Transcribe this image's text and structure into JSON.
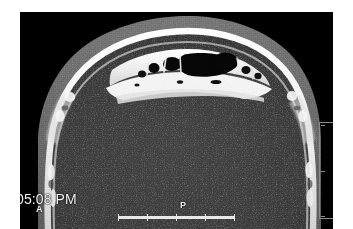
{
  "viewer": {
    "modality": "CT",
    "view": "axial",
    "region": "frontal sinuses",
    "background_color": "#ffffff",
    "image_background_color": "#000000"
  },
  "overlays": {
    "timestamp": "05:08 PM",
    "orientation_anterior": "A",
    "orientation_posterior": "P",
    "text_color": "#f2f2f2"
  },
  "scalebar": {
    "name": "horizontal-scale-bar",
    "tick_positions_pct": [
      0,
      25,
      50,
      75,
      100
    ],
    "color": "#e8e8e8"
  },
  "vertical_scale": {
    "name": "vertical-scale-bar",
    "tick_positions_pct": [
      2,
      50,
      98
    ],
    "color": "#8d8d8d"
  },
  "anatomy": {
    "scalp_color": "#6a6a6a",
    "soft_tissue_color": "#3a3a3a",
    "cortical_bone_color": "#f0f0f0",
    "cancellous_bone_color": "#9a9a9a",
    "air_color": "#070707",
    "labels": {
      "scalp": "scalp soft tissue",
      "soft_tissue": "intracranial soft tissue",
      "bone": "cortical bone table",
      "sinus": "frontal sinus air cell"
    }
  }
}
